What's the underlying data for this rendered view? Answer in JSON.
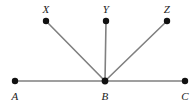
{
  "figure": {
    "type": "geometry-diagram",
    "width": 196,
    "height": 107,
    "background_color": "#ffffff",
    "line_color": "#808080",
    "dot_color": "#111111",
    "label_color": "#1b1b1b",
    "line_width": 1.6,
    "dot_radius": 3.2
  },
  "points": [
    {
      "id": "A",
      "label": "A",
      "x": 15,
      "y": 81,
      "label_x": 15,
      "label_y": 96
    },
    {
      "id": "B",
      "label": "B",
      "x": 105,
      "y": 81,
      "label_x": 105,
      "label_y": 96
    },
    {
      "id": "C",
      "label": "C",
      "x": 185,
      "y": 81,
      "label_x": 185,
      "label_y": 96
    },
    {
      "id": "X",
      "label": "X",
      "x": 46,
      "y": 21,
      "label_x": 46,
      "label_y": 9
    },
    {
      "id": "Y",
      "label": "Y",
      "x": 106,
      "y": 21,
      "label_x": 106,
      "label_y": 9
    },
    {
      "id": "Z",
      "label": "Z",
      "x": 167,
      "y": 21,
      "label_x": 167,
      "label_y": 9
    }
  ],
  "segments": [
    {
      "id": "AC",
      "from": "A",
      "to": "C",
      "x1": 15,
      "y1": 81,
      "x2": 185,
      "y2": 81
    },
    {
      "id": "BX",
      "from": "B",
      "to": "X",
      "x1": 105,
      "y1": 81,
      "x2": 46,
      "y2": 21
    },
    {
      "id": "BY",
      "from": "B",
      "to": "Y",
      "x1": 105,
      "y1": 81,
      "x2": 106,
      "y2": 21
    },
    {
      "id": "BZ",
      "from": "B",
      "to": "Z",
      "x1": 105,
      "y1": 81,
      "x2": 167,
      "y2": 21
    }
  ],
  "labels": {
    "A": "A",
    "B": "B",
    "C": "C",
    "X": "X",
    "Y": "Y",
    "Z": "Z"
  }
}
